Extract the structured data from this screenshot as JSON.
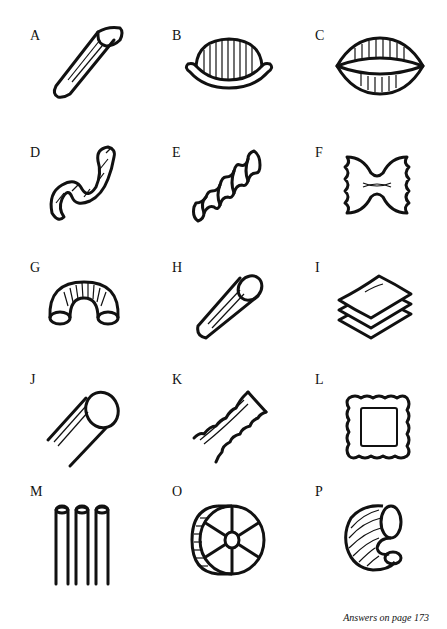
{
  "puzzle": {
    "items": [
      {
        "letter": "A",
        "shape": "penne-icon"
      },
      {
        "letter": "B",
        "shape": "orecchiette-icon"
      },
      {
        "letter": "C",
        "shape": "conchiglie-icon"
      },
      {
        "letter": "D",
        "shape": "spiral-ribbon-icon"
      },
      {
        "letter": "E",
        "shape": "fusilli-icon"
      },
      {
        "letter": "F",
        "shape": "farfalle-icon"
      },
      {
        "letter": "G",
        "shape": "elbow-macaroni-icon"
      },
      {
        "letter": "H",
        "shape": "tube-pasta-icon"
      },
      {
        "letter": "I",
        "shape": "lasagne-sheets-icon"
      },
      {
        "letter": "J",
        "shape": "cannelloni-icon"
      },
      {
        "letter": "K",
        "shape": "tagliatelle-icon"
      },
      {
        "letter": "L",
        "shape": "ravioli-icon"
      },
      {
        "letter": "M",
        "shape": "bucatini-icon"
      },
      {
        "letter": "O",
        "shape": "rotelle-icon"
      },
      {
        "letter": "P",
        "shape": "lumache-icon"
      }
    ]
  },
  "footer": {
    "text": "Answers on page 173"
  }
}
